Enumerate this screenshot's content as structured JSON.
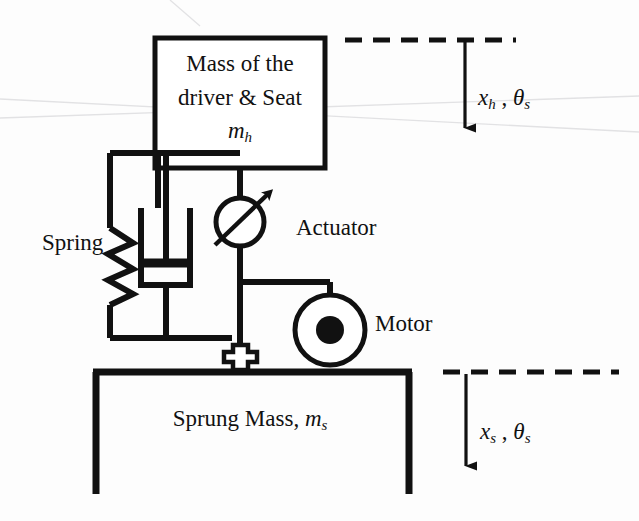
{
  "figure": {
    "background_color": "#fdfdfd",
    "line_color": "#111111"
  },
  "labels": {
    "seat_mass_line1": "Mass of the",
    "seat_mass_line2": "driver & Seat",
    "seat_mass_symbol_base": "m",
    "seat_mass_symbol_sub": "h",
    "spring": "Spring",
    "actuator": "Actuator",
    "motor": "Motor",
    "sprung_mass_text": "Sprung Mass, ",
    "sprung_mass_symbol_base": "m",
    "sprung_mass_symbol_sub": "s"
  },
  "coordinates": {
    "top": {
      "displacement_base": "x",
      "displacement_sub": "h",
      "comma": " , ",
      "angle_base": "θ",
      "angle_sub": "s"
    },
    "bottom": {
      "displacement_base": "x",
      "displacement_sub": "s",
      "comma": " , ",
      "angle_base": "θ",
      "angle_sub": "s"
    }
  },
  "components": [
    {
      "name": "seat-mass-box",
      "type": "rectangle"
    },
    {
      "name": "spring",
      "type": "zigzag-spring"
    },
    {
      "name": "damper",
      "type": "dashpot"
    },
    {
      "name": "actuator",
      "type": "circle-with-arrow"
    },
    {
      "name": "motor",
      "type": "circle-with-hub"
    },
    {
      "name": "pivot-joint",
      "type": "cross"
    },
    {
      "name": "sprung-mass-frame",
      "type": "open-rectangle"
    },
    {
      "name": "top-reference-line",
      "type": "dashed-line"
    },
    {
      "name": "bottom-reference-line",
      "type": "dashed-line"
    },
    {
      "name": "top-displacement-arrow",
      "type": "arrow-down"
    },
    {
      "name": "bottom-displacement-arrow",
      "type": "arrow-down"
    }
  ]
}
